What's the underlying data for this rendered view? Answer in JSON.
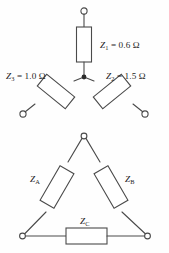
{
  "figure": {
    "background_color": "#fefefe",
    "line_color": "#4a4a4a",
    "text_color": "#1f1f1f"
  },
  "wye": {
    "name": "wye-network",
    "center_node_label": "",
    "branches": [
      {
        "id": "z1",
        "symbol": "Z",
        "subscript": "1",
        "separator": " = ",
        "value": "0.6",
        "unit": "Ω",
        "label": "Z₁ = 0.6 Ω",
        "orientation": "vertical-top"
      },
      {
        "id": "z2",
        "symbol": "Z",
        "subscript": "2",
        "separator": " = ",
        "value": "1.5",
        "unit": "Ω",
        "label": "Z₂ = 1.5 Ω",
        "orientation": "diagonal-lower-right"
      },
      {
        "id": "z3",
        "symbol": "Z",
        "subscript": "3",
        "separator": " = ",
        "value": "1.0",
        "unit": "Ω",
        "label": "Z₃ = 1.0 Ω",
        "orientation": "diagonal-lower-left"
      }
    ]
  },
  "delta": {
    "name": "delta-network",
    "branches": [
      {
        "id": "za",
        "symbol": "Z",
        "subscript": "A",
        "label": "Zᴀ",
        "orientation": "left-leg"
      },
      {
        "id": "zb",
        "symbol": "Z",
        "subscript": "B",
        "label": "Zʙ",
        "orientation": "right-leg"
      },
      {
        "id": "zc",
        "symbol": "Z",
        "subscript": "C",
        "label": "Zᴄ",
        "orientation": "bottom-leg"
      }
    ]
  }
}
